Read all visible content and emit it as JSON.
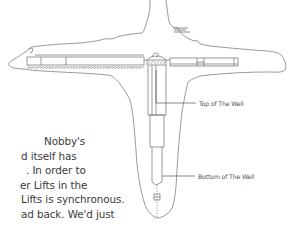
{
  "diagram": {
    "labels": {
      "top_of_well": "Top of The Well",
      "bottom_of_well": "Bottom of The Well"
    },
    "line_color": "#6e6e6e"
  },
  "body_text": {
    "lines": [
      "Nobby's",
      "d itself has",
      ". In order to",
      "er Lifts in the",
      "Lifts is synchronous.",
      "ad back. We'd just"
    ]
  }
}
